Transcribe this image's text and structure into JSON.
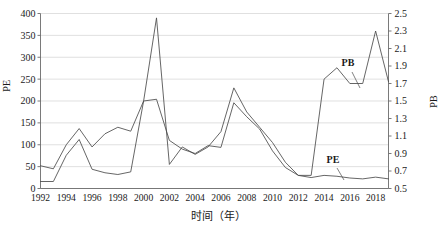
{
  "chart_data": {
    "type": "line",
    "title": "",
    "xlabel": "时间（年）",
    "ylabel": "PE",
    "y2label": "PB",
    "grid": true,
    "legend_position": "inline-annotations",
    "xlim": [
      1992,
      2019
    ],
    "ylim": [
      0,
      400
    ],
    "y2lim": [
      0.5,
      2.5
    ],
    "yticks": [
      0,
      50,
      100,
      150,
      200,
      250,
      300,
      350,
      400
    ],
    "y2ticks": [
      0.5,
      0.7,
      0.9,
      1.1,
      1.3,
      1.5,
      1.7,
      1.9,
      2.1,
      2.3,
      2.5
    ],
    "xticks": [
      1992,
      1994,
      1996,
      1998,
      2000,
      2002,
      2004,
      2006,
      2008,
      2010,
      2012,
      2014,
      2016,
      2018
    ],
    "x": [
      1992,
      1993,
      1994,
      1995,
      1996,
      1997,
      1998,
      1999,
      2000,
      2001,
      2002,
      2003,
      2004,
      2005,
      2006,
      2007,
      2008,
      2009,
      2010,
      2011,
      2012,
      2013,
      2014,
      2015,
      2016,
      2017,
      2018,
      2019
    ],
    "series": [
      {
        "name": "PE",
        "axis": "left",
        "color": "#4a4a4a",
        "annotation": "PE",
        "values": [
          52,
          45,
          100,
          137,
          95,
          125,
          140,
          131,
          200,
          390,
          55,
          95,
          78,
          95,
          130,
          230,
          175,
          140,
          105,
          60,
          30,
          25,
          30,
          28,
          24,
          22,
          26,
          22
        ]
      },
      {
        "name": "PB",
        "axis": "right",
        "color": "#4a4a4a",
        "annotation": "PB",
        "values": [
          0.58,
          0.58,
          0.88,
          1.06,
          0.72,
          0.68,
          0.66,
          0.69,
          1.5,
          1.52,
          1.05,
          0.95,
          0.9,
          0.99,
          0.97,
          1.48,
          1.32,
          1.18,
          0.93,
          0.74,
          0.65,
          0.65,
          1.75,
          1.88,
          1.7,
          1.7,
          2.3,
          1.72
        ]
      }
    ],
    "annotations": [
      {
        "text": "PB",
        "x_px": 348,
        "y_px": 66
      },
      {
        "text": "PE",
        "x_px": 333,
        "y_px": 163
      }
    ]
  },
  "axes": {
    "left": {
      "title": "PE"
    },
    "right": {
      "title": "PB"
    },
    "bottom": {
      "title": "时间（年）"
    }
  }
}
